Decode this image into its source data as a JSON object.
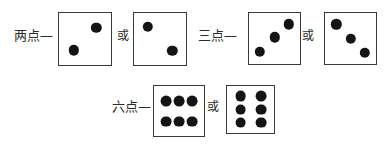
{
  "figure": {
    "background_color": "#ffffff",
    "ink_color": "#141414",
    "die_border_color": "#3a3a3a",
    "rows": [
      {
        "name": "two-points-row",
        "label": "两点—",
        "label_x": 14,
        "label_y": 29,
        "conjunction": "或",
        "conjunction_x": 117,
        "conjunction_y": 30,
        "dice": [
          {
            "name": "die-two-a",
            "x": 58,
            "y": 12,
            "size": 54,
            "pip_radius": 5.2,
            "pips": [
              {
                "cx": 72,
                "cy": 28
              },
              {
                "cx": 28,
                "cy": 72
              }
            ]
          },
          {
            "name": "die-two-b",
            "x": 133,
            "y": 12,
            "size": 54,
            "pip_radius": 5.2,
            "pips": [
              {
                "cx": 26,
                "cy": 26
              },
              {
                "cx": 74,
                "cy": 73
              }
            ]
          }
        ]
      },
      {
        "name": "three-points-row",
        "label": "三点—",
        "label_x": 198,
        "label_y": 29,
        "conjunction": "或",
        "conjunction_x": 302,
        "conjunction_y": 30,
        "dice": [
          {
            "name": "die-three-a",
            "x": 248,
            "y": 12,
            "size": 53,
            "pip_radius": 5.2,
            "pips": [
              {
                "cx": 78,
                "cy": 22
              },
              {
                "cx": 50,
                "cy": 48
              },
              {
                "cx": 21,
                "cy": 76
              }
            ]
          },
          {
            "name": "die-three-b",
            "x": 324,
            "y": 12,
            "size": 53,
            "pip_radius": 5.2,
            "pips": [
              {
                "cx": 22,
                "cy": 22
              },
              {
                "cx": 50,
                "cy": 50
              },
              {
                "cx": 78,
                "cy": 78
              }
            ]
          }
        ]
      },
      {
        "name": "six-points-row",
        "label": "六点—",
        "label_x": 112,
        "label_y": 100,
        "conjunction": "或",
        "conjunction_x": 207,
        "conjunction_y": 101,
        "dice": [
          {
            "name": "die-six-a",
            "x": 153,
            "y": 85,
            "size": 52,
            "pip_radius": 5.4,
            "pips": [
              {
                "cx": 24,
                "cy": 30
              },
              {
                "cx": 50,
                "cy": 30
              },
              {
                "cx": 76,
                "cy": 30
              },
              {
                "cx": 24,
                "cy": 71
              },
              {
                "cx": 50,
                "cy": 71
              },
              {
                "cx": 76,
                "cy": 71
              }
            ]
          },
          {
            "name": "die-six-b",
            "x": 226,
            "y": 85,
            "size": 49,
            "pip_radius": 5.4,
            "pips": [
              {
                "cx": 29,
                "cy": 22
              },
              {
                "cx": 72,
                "cy": 22
              },
              {
                "cx": 29,
                "cy": 50
              },
              {
                "cx": 72,
                "cy": 50
              },
              {
                "cx": 29,
                "cy": 78
              },
              {
                "cx": 72,
                "cy": 78
              }
            ]
          }
        ]
      }
    ]
  }
}
